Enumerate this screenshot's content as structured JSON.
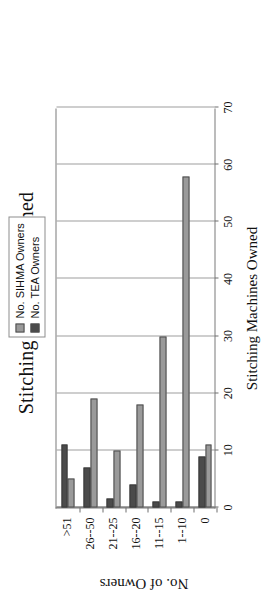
{
  "chart_data": {
    "type": "bar",
    "orientation": "horizontal",
    "title": "Stitching Machines Owned",
    "xlabel": "Stitching Machines Owned",
    "ylabel": "No. of Owners",
    "categories": [
      "0",
      "1--10",
      "11--15",
      "16--20",
      "21--25",
      "26--50",
      ">51"
    ],
    "value_ticks": [
      "0",
      "10",
      "20",
      "30",
      "40",
      "50",
      "60",
      "70"
    ],
    "value_tick_numbers": [
      0,
      10,
      20,
      30,
      40,
      50,
      60,
      70
    ],
    "ylim": [
      0,
      70
    ],
    "grid": "value-axis-gridlines",
    "legend_position": "top-right-outside",
    "series": [
      {
        "name": "No. SIHMA Owners",
        "color": "#9a9a9a",
        "values": [
          11,
          58,
          30,
          18,
          10,
          19,
          5
        ]
      },
      {
        "name": "No. TEA Owners",
        "color": "#4b4b4b",
        "values": [
          9,
          1,
          1,
          4,
          1.5,
          7,
          11
        ]
      }
    ]
  },
  "legend": {
    "items": [
      {
        "label": "No. SIHMA Owners",
        "color": "#9a9a9a"
      },
      {
        "label": "No. TEA Owners",
        "color": "#4b4b4b"
      }
    ]
  },
  "colors": {
    "series1": "#9a9a9a",
    "series2": "#4b4b4b",
    "axis": "#4a4a4a",
    "grid": "#9d9d9d",
    "text": "#111111",
    "background": "#ffffff"
  }
}
